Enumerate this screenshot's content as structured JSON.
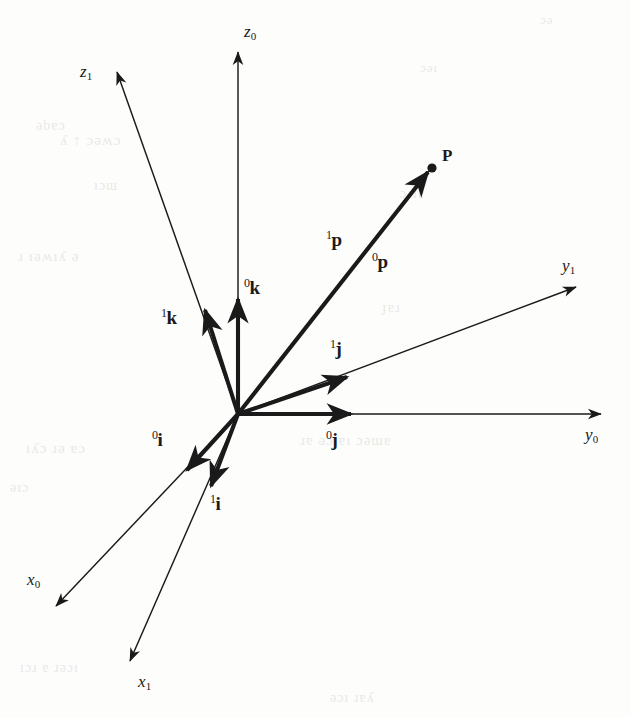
{
  "figure": {
    "kind": "vector-geometry-diagram",
    "ink_color": "#1a1a1a",
    "background_color": "#fdfdfc"
  },
  "origin": {
    "x": 238,
    "y": 414,
    "label": ""
  },
  "axes": [
    {
      "name": "z-axis frame 0",
      "label_base": "z",
      "label_sub": "0",
      "style": "thin",
      "tip": {
        "x": 238,
        "y": 52
      },
      "label_pos": {
        "x": 244,
        "y": 22
      }
    },
    {
      "name": "z-axis frame 1",
      "label_base": "z",
      "label_sub": "1",
      "style": "thin",
      "tip": {
        "x": 117,
        "y": 72
      },
      "label_pos": {
        "x": 80,
        "y": 62
      }
    },
    {
      "name": "y-axis frame 0",
      "label_base": "y",
      "label_sub": "0",
      "style": "thin",
      "tip": {
        "x": 601,
        "y": 414
      },
      "label_pos": {
        "x": 585,
        "y": 425
      }
    },
    {
      "name": "y-axis frame 1",
      "label_base": "y",
      "label_sub": "1",
      "style": "thin",
      "tip": {
        "x": 576,
        "y": 287
      },
      "label_pos": {
        "x": 562,
        "y": 256
      }
    },
    {
      "name": "x-axis frame 0",
      "label_base": "x",
      "label_sub": "0",
      "style": "thin",
      "tip": {
        "x": 56,
        "y": 606
      },
      "label_pos": {
        "x": 27,
        "y": 570
      }
    },
    {
      "name": "x-axis frame 1",
      "label_base": "x",
      "label_sub": "1",
      "style": "thin",
      "tip": {
        "x": 130,
        "y": 661
      },
      "label_pos": {
        "x": 138,
        "y": 672
      }
    }
  ],
  "unit_vectors": [
    {
      "name": "k-hat frame 0",
      "sup": "0",
      "base": "k",
      "style": "thick",
      "tip": {
        "x": 238,
        "y": 299
      },
      "label_pos": {
        "x": 244,
        "y": 276
      }
    },
    {
      "name": "k-hat frame 1",
      "sup": "1",
      "base": "k",
      "style": "thick",
      "tip": {
        "x": 205,
        "y": 310
      },
      "label_pos": {
        "x": 161,
        "y": 306
      }
    },
    {
      "name": "j-hat frame 0",
      "sup": "0",
      "base": "j",
      "style": "thick",
      "tip": {
        "x": 351,
        "y": 414
      },
      "label_pos": {
        "x": 326,
        "y": 428
      }
    },
    {
      "name": "j-hat frame 1",
      "sup": "1",
      "base": "j",
      "style": "thick",
      "tip": {
        "x": 347,
        "y": 377
      },
      "label_pos": {
        "x": 330,
        "y": 337
      }
    },
    {
      "name": "i-hat frame 0",
      "sup": "0",
      "base": "i",
      "style": "thick",
      "tip": {
        "x": 187,
        "y": 470
      },
      "label_pos": {
        "x": 152,
        "y": 428
      }
    },
    {
      "name": "i-hat frame 1",
      "sup": "1",
      "base": "i",
      "style": "thick",
      "tip": {
        "x": 211,
        "y": 486
      },
      "label_pos": {
        "x": 210,
        "y": 492
      }
    }
  ],
  "position_vector": {
    "name": "position-vector-to-P",
    "style": "thick",
    "tip": {
      "x": 428,
      "y": 172
    },
    "labels": [
      {
        "name": "p-frame-1",
        "sup": "1",
        "base": "p",
        "label_pos": {
          "x": 326,
          "y": 228
        }
      },
      {
        "name": "p-frame-0",
        "sup": "0",
        "base": "p",
        "label_pos": {
          "x": 372,
          "y": 250
        }
      }
    ]
  },
  "point": {
    "name": "point-P",
    "label": "P",
    "dot": {
      "x": 432,
      "y": 168,
      "r": 4.6
    },
    "label_pos": {
      "x": 442,
      "y": 146
    }
  },
  "bleed_through": [
    {
      "text": "ɔǝ",
      "x": 540,
      "y": 12,
      "size": 13
    },
    {
      "text": "ǝbɐɔ",
      "x": 36,
      "y": 118,
      "size": 14
    },
    {
      "text": "ʎ ↑ ɔǝʍɔ",
      "x": 60,
      "y": 132,
      "size": 15
    },
    {
      "text": "ıɔɯ",
      "x": 94,
      "y": 178,
      "size": 14
    },
    {
      "text": "ɹ ıǝʍıʎ  ǝ",
      "x": 18,
      "y": 248,
      "size": 15
    },
    {
      "text": "ɔıɹɐ",
      "x": 400,
      "y": 186,
      "size": 14
    },
    {
      "text": "ɟɐɹ",
      "x": 382,
      "y": 300,
      "size": 14
    },
    {
      "text": "ıʎɔ ɹǝ  ɐɔ",
      "x": 26,
      "y": 440,
      "size": 15
    },
    {
      "text": "ǝıɔ",
      "x": 10,
      "y": 480,
      "size": 14
    },
    {
      "text": "ɹɐ ǝɔ  ɐı  ɔǝɯɐ",
      "x": 300,
      "y": 432,
      "size": 15
    },
    {
      "text": "ıɔɹ ɐ ɹǝɔı",
      "x": 20,
      "y": 660,
      "size": 14
    },
    {
      "text": "ǝɔı ɹɐʎ",
      "x": 330,
      "y": 690,
      "size": 14
    },
    {
      "text": "ɔǝı",
      "x": 420,
      "y": 60,
      "size": 13
    }
  ]
}
